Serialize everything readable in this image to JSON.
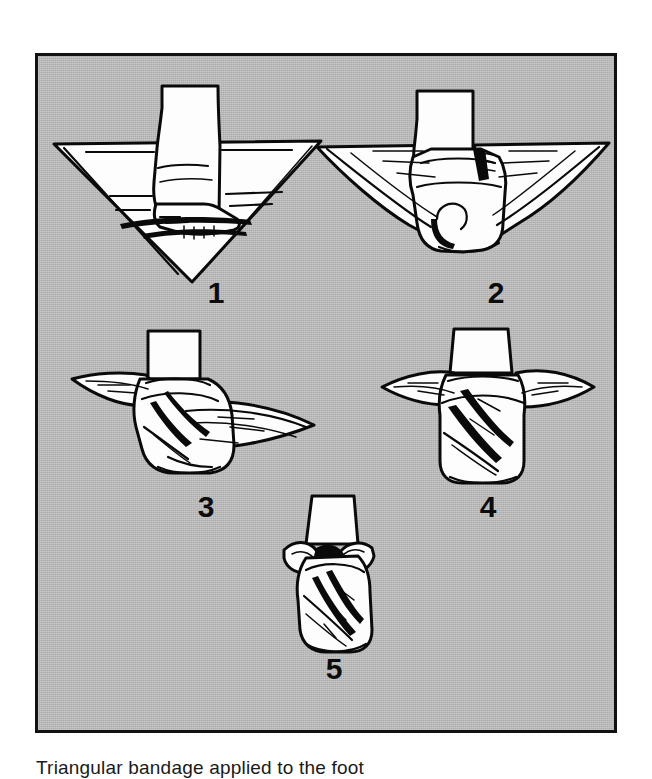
{
  "panel": {
    "background_color": "#bcbcbc",
    "border_color": "#111111"
  },
  "figures": [
    {
      "number": "1",
      "name": "triangular-bandage-foot-placed",
      "description": "Foot placed on the centre of an open triangular bandage with the apex pointing away from the toes"
    },
    {
      "number": "2",
      "name": "triangular-bandage-apex-folded-over",
      "description": "Apex of the bandage folded up over the top of the foot"
    },
    {
      "number": "3",
      "name": "triangular-bandage-ends-crossed-side-view",
      "description": "Side view with the two ends brought up and crossed over the instep and around the ankle"
    },
    {
      "number": "4",
      "name": "triangular-bandage-ends-wrapped-front-view",
      "description": "Front view with the ends wrapped around the ankle and brought forward"
    },
    {
      "number": "5",
      "name": "triangular-bandage-tied-finished",
      "description": "Completed foot dressing with the ends tied in a knot at the front of the ankle"
    }
  ],
  "caption": {
    "text": "Triangular bandage applied to the foot"
  }
}
